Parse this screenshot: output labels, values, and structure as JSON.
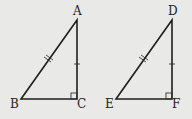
{
  "figure": {
    "background": "#e9e9e7",
    "triangles": [
      {
        "name": "ABC",
        "vertices": {
          "A": "A",
          "B": "B",
          "C": "C"
        },
        "right_angle_at": "C",
        "hypotenuse": "AB",
        "hypotenuse_marks": "double-tick",
        "leg_marked": "AC",
        "leg_marks": "single-tick"
      },
      {
        "name": "DEF",
        "vertices": {
          "D": "D",
          "E": "E",
          "F": "F"
        },
        "right_angle_at": "F",
        "hypotenuse": "DE",
        "hypotenuse_marks": "double-tick",
        "leg_marked": "DF",
        "leg_marks": "single-tick"
      }
    ]
  }
}
